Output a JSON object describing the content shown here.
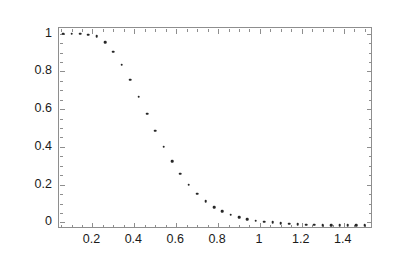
{
  "chart_data": {
    "type": "scatter",
    "title": "",
    "subtitle": "",
    "xlabel": "",
    "ylabel": "",
    "xlim": [
      0.04,
      1.54
    ],
    "ylim": [
      -0.035,
      1.03
    ],
    "grid": false,
    "legend": null,
    "marker": "point",
    "marker_color": "#262626",
    "frame_color": "#8e8e8e",
    "background": "#ffffff",
    "xticks": [
      0.2,
      0.4,
      0.6,
      0.8,
      1.0,
      1.2,
      1.4
    ],
    "xticklabels": [
      "0.2",
      "0.4",
      "0.6",
      "0.8",
      "1",
      "1.2",
      "1.4"
    ],
    "yticks": [
      0.0,
      0.2,
      0.4,
      0.6,
      0.8,
      1.0
    ],
    "yticklabels": [
      "0",
      "0.2",
      "0.4",
      "0.6",
      "0.8",
      "1"
    ],
    "x_minor_tick_step": 0.05,
    "y_minor_tick_step": 0.05,
    "series": [
      {
        "name": "data",
        "x": [
          0.06,
          0.1,
          0.14,
          0.18,
          0.22,
          0.26,
          0.3,
          0.34,
          0.38,
          0.42,
          0.46,
          0.5,
          0.54,
          0.58,
          0.62,
          0.66,
          0.7,
          0.74,
          0.78,
          0.82,
          0.86,
          0.9,
          0.94,
          0.98,
          1.02,
          1.06,
          1.1,
          1.14,
          1.18,
          1.22,
          1.26,
          1.3,
          1.34,
          1.38,
          1.42,
          1.46,
          1.5
        ],
        "y": [
          1.0,
          1.0,
          1.0,
          0.995,
          0.985,
          0.955,
          0.905,
          0.835,
          0.755,
          0.665,
          0.575,
          0.485,
          0.4,
          0.325,
          0.258,
          0.2,
          0.152,
          0.113,
          0.082,
          0.058,
          0.04,
          0.026,
          0.016,
          0.009,
          0.004,
          0.001,
          -0.004,
          -0.008,
          -0.01,
          -0.012,
          -0.013,
          -0.014,
          -0.014,
          -0.015,
          -0.015,
          -0.015,
          -0.015
        ]
      }
    ]
  }
}
